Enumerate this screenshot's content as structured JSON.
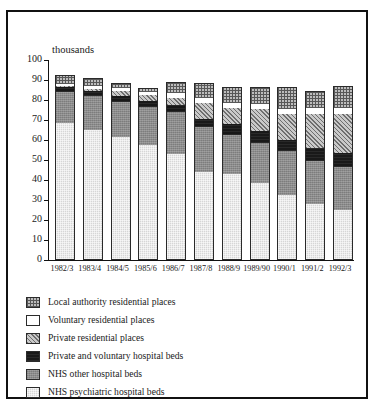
{
  "chart_data": {
    "type": "bar",
    "stacked": true,
    "title": "",
    "subtitle": "",
    "xlabel": "",
    "ylabel": "thousands",
    "units_label": "thousands",
    "ylim": [
      0,
      100
    ],
    "ytick_step": 10,
    "yticks": [
      0,
      10,
      20,
      30,
      40,
      50,
      60,
      70,
      80,
      90,
      100
    ],
    "ytick_labels": [
      "0",
      "10",
      "20",
      "30",
      "40",
      "50",
      "60",
      "70",
      "80",
      "90",
      "100"
    ],
    "grid": false,
    "legend_position": "below-plot",
    "categories": [
      "1982/3",
      "1983/4",
      "1984/5",
      "1985/6",
      "1986/7",
      "1987/8",
      "1988/9",
      "1989/90",
      "1990/1",
      "1991/2",
      "1992/3"
    ],
    "series": [
      {
        "name": "NHS psychiatric hospital beds",
        "pattern": "pat-psych",
        "order": 1,
        "values": [
          68.5,
          65,
          61.5,
          57.5,
          53,
          44,
          43,
          38.5,
          32.5,
          28,
          25
        ]
      },
      {
        "name": "NHS other hospital beds",
        "pattern": "pat-nhsother",
        "order": 2,
        "values": [
          15.5,
          17,
          17.5,
          19,
          21,
          22.5,
          19.5,
          20,
          22,
          21.5,
          21.5
        ]
      },
      {
        "name": "Private and voluntary hospital beds",
        "pattern": "pat-pvhosp",
        "order": 3,
        "values": [
          2.5,
          2.5,
          3,
          3,
          3.5,
          4,
          5.5,
          6,
          5.5,
          6.5,
          7
        ]
      },
      {
        "name": "Private residential places",
        "pattern": "pat-private",
        "order": 4,
        "values": [
          0.5,
          1,
          2.5,
          3,
          3.5,
          8,
          8,
          11,
          13,
          17,
          19.5
        ]
      },
      {
        "name": "Voluntary residential places",
        "pattern": "pat-voluntary",
        "order": 5,
        "values": [
          1,
          1.5,
          1.5,
          1.5,
          2.5,
          2.5,
          2.5,
          2.5,
          2.5,
          3,
          3
        ]
      },
      {
        "name": "Local authority residential places",
        "pattern": "pat-localauth",
        "order": 6,
        "values": [
          4.5,
          4,
          2.5,
          2,
          5.5,
          7.5,
          8,
          8.5,
          11,
          8.5,
          11
        ]
      }
    ],
    "totals": [
      92.5,
      91,
      88.5,
      86,
      89,
      88.5,
      86.5,
      86.5,
      86.5,
      84.5,
      87
    ]
  },
  "legend": {
    "items": [
      {
        "label": "Local authority residential places",
        "pattern": "pat-localauth"
      },
      {
        "label": "Voluntary residential places",
        "pattern": "pat-voluntary"
      },
      {
        "label": "Private residential places",
        "pattern": "pat-private"
      },
      {
        "label": "Private and voluntary hospital beds",
        "pattern": "pat-pvhosp"
      },
      {
        "label": "NHS other hospital beds",
        "pattern": "pat-nhsother"
      },
      {
        "label": "NHS psychiatric hospital beds",
        "pattern": "pat-psych"
      }
    ]
  }
}
